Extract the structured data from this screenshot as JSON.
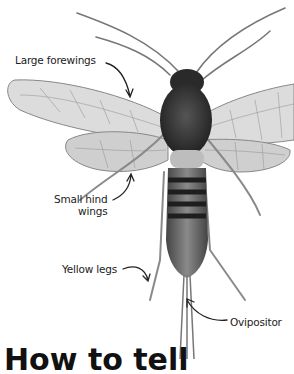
{
  "figure": {
    "labels": {
      "forewings": "Large forewings",
      "hindwings_line1": "Small hind",
      "hindwings_line2": "wings",
      "legs": "Yellow legs",
      "ovipositor": "Ovipositor"
    }
  },
  "heading": {
    "text": "How to tell"
  },
  "colors": {
    "ink": "#222222",
    "body_dark": "#2a2a2a",
    "body_mid": "#6e6e6e",
    "wing": "#d8d8d8",
    "background": "#ffffff"
  }
}
